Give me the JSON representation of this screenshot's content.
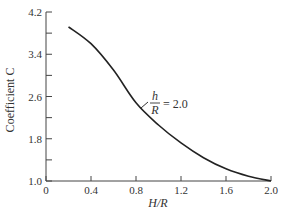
{
  "chart_data": {
    "type": "line",
    "title": "",
    "xlabel": "H/R",
    "ylabel": "Coefficient C",
    "xlim": [
      0,
      2.0
    ],
    "ylim": [
      1.0,
      4.2
    ],
    "xticks": [
      "0",
      "0.4",
      "0.8",
      "1.2",
      "1.6",
      "2.0"
    ],
    "yticks": [
      "1.0",
      "1.8",
      "2.6",
      "3.4",
      "4.2"
    ],
    "grid": false,
    "legend": null,
    "series": [
      {
        "name": "h/R = 2.0",
        "x": [
          0.2,
          0.4,
          0.6,
          0.8,
          1.0,
          1.2,
          1.4,
          1.6,
          1.8,
          2.0
        ],
        "y": [
          3.92,
          3.6,
          3.1,
          2.48,
          2.06,
          1.72,
          1.44,
          1.23,
          1.09,
          1.0
        ]
      }
    ],
    "annotations": [
      {
        "text_num": "h",
        "text_den": "R",
        "text_rest": "= 2.0",
        "x": 0.75,
        "y": 2.6
      }
    ]
  }
}
